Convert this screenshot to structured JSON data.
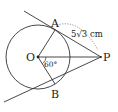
{
  "diagram": {
    "type": "geometry",
    "points": {
      "O": {
        "label": "O"
      },
      "A": {
        "label": "A"
      },
      "B": {
        "label": "B"
      },
      "P": {
        "label": "P"
      }
    },
    "measurements": {
      "tangent_length": "5√3 cm",
      "angle_AOP": "60°"
    },
    "colors": {
      "stroke": "#333333",
      "text": "#222222",
      "background": "#ffffff"
    }
  }
}
